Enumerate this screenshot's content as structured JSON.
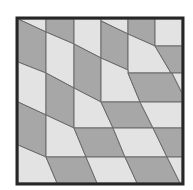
{
  "figure": {
    "title": "",
    "colors": {
      "background": "#ffffff",
      "light_tile": "#e3e3e3",
      "dark_tile": "#a7a7a7",
      "edge": "#6a6a6a",
      "frame": "#262626"
    },
    "frame": {
      "x": 17,
      "y": 18,
      "width": 166,
      "height": 166,
      "stroke_width": 3
    },
    "tiles": [
      {
        "shade": "light",
        "points": "18,19 46,19 46,32 18,19"
      },
      {
        "shade": "dark",
        "points": "46,19 74,19 74,44 46,32"
      },
      {
        "shade": "light",
        "points": "74,19 101,19 101,58 74,44"
      },
      {
        "shade": "light",
        "points": "101,19 128,19 128,34 101,21"
      },
      {
        "shade": "dark",
        "points": "128,19 155,19 155,46 128,34"
      },
      {
        "shade": "light",
        "points": "155,19 182,19 182,46 155,46"
      },
      {
        "shade": "dark",
        "points": "18,19 46,32 46,73 18,62"
      },
      {
        "shade": "light",
        "points": "46,32 74,44 74,88 46,73"
      },
      {
        "shade": "dark",
        "points": "74,44 101,58 101,102 74,88"
      },
      {
        "shade": "dark",
        "points": "101,21 128,34 128,70 101,58"
      },
      {
        "shade": "light",
        "points": "128,34 155,46 171,73 128,73"
      },
      {
        "shade": "dark",
        "points": "155,46 182,46 182,73 171,73"
      },
      {
        "shade": "light",
        "points": "101,58 128,70 128,73 140,102 101,102"
      },
      {
        "shade": "dark",
        "points": "128,73 172,73 182,93 182,102 140,102"
      },
      {
        "shade": "light",
        "points": "172,73 182,73 182,93"
      },
      {
        "shade": "light",
        "points": "18,62 46,73 46,115 18,102"
      },
      {
        "shade": "dark",
        "points": "46,73 74,88 74,128 46,115"
      },
      {
        "shade": "light",
        "points": "74,88 101,102 113,128 74,128"
      },
      {
        "shade": "dark",
        "points": "101,102 140,102 153,128 113,128"
      },
      {
        "shade": "light",
        "points": "140,102 182,102 182,128 153,128"
      },
      {
        "shade": "dark",
        "points": "18,102 46,115 46,157 18,145"
      },
      {
        "shade": "light",
        "points": "46,115 74,128 86,157 46,157"
      },
      {
        "shade": "dark",
        "points": "74,128 113,128 125,157 86,157"
      },
      {
        "shade": "light",
        "points": "113,128 153,128 167,157 125,157"
      },
      {
        "shade": "dark",
        "points": "153,128 182,128 182,157 167,157"
      },
      {
        "shade": "light",
        "points": "18,145 46,157 57,183 18,183"
      },
      {
        "shade": "dark",
        "points": "46,157 86,157 97,183 57,183"
      },
      {
        "shade": "light",
        "points": "86,157 125,157 137,183 97,183"
      },
      {
        "shade": "dark",
        "points": "125,157 167,157 180,183 137,183"
      },
      {
        "shade": "light",
        "points": "167,157 182,157 182,183 180,183"
      }
    ]
  }
}
